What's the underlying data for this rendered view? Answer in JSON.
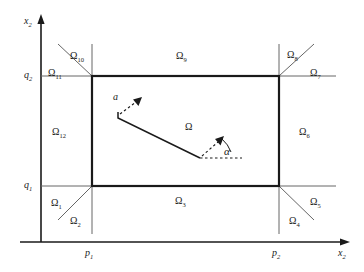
{
  "figure": {
    "type": "geometric-region-diagram"
  },
  "axes": {
    "vertical": {
      "label": "x",
      "subscript": "2",
      "arrow": "up"
    },
    "horizontal": {
      "label": "x",
      "subscript": "2",
      "arrow": "right"
    },
    "y_ticks": [
      {
        "label": "q",
        "subscript": "1"
      },
      {
        "label": "q",
        "subscript": "2"
      }
    ],
    "x_ticks": [
      {
        "label": "p",
        "subscript": "1"
      },
      {
        "label": "p",
        "subscript": "2"
      }
    ]
  },
  "regions": {
    "center": {
      "label": "Ω",
      "subscript": ""
    },
    "items": [
      {
        "label": "Ω",
        "subscript": "1"
      },
      {
        "label": "Ω",
        "subscript": "2"
      },
      {
        "label": "Ω",
        "subscript": "3"
      },
      {
        "label": "Ω",
        "subscript": "4"
      },
      {
        "label": "Ω",
        "subscript": "5"
      },
      {
        "label": "Ω",
        "subscript": "6"
      },
      {
        "label": "Ω",
        "subscript": "7"
      },
      {
        "label": "Ω",
        "subscript": "8"
      },
      {
        "label": "Ω",
        "subscript": "9"
      },
      {
        "label": "Ω",
        "subscript": "10"
      },
      {
        "label": "Ω",
        "subscript": "11"
      },
      {
        "label": "Ω",
        "subscript": "12"
      }
    ]
  },
  "annotations": {
    "vector_label": "a",
    "angle_label": "α"
  },
  "colors": {
    "stroke": "#1a1a1a",
    "thin_stroke": "#555555",
    "background": "#ffffff"
  }
}
